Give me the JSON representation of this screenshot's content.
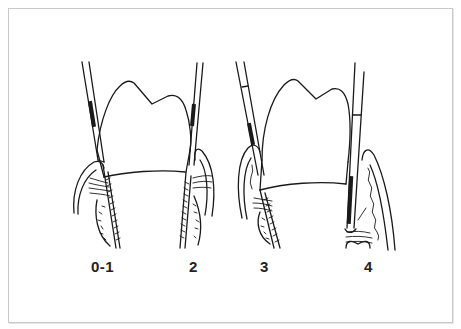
{
  "figure": {
    "panels": [
      {
        "id": "panel-left-tooth",
        "labels": [
          "0-1",
          "2"
        ]
      },
      {
        "id": "panel-right-tooth",
        "labels": [
          "3",
          "4"
        ]
      }
    ],
    "labels": {
      "stage_0_1": "0-1",
      "stage_2": "2",
      "stage_3": "3",
      "stage_4": "4"
    },
    "colors": {
      "ink": "#1a1a1a",
      "frame": "#c9c9c9",
      "background": "#ffffff"
    }
  }
}
